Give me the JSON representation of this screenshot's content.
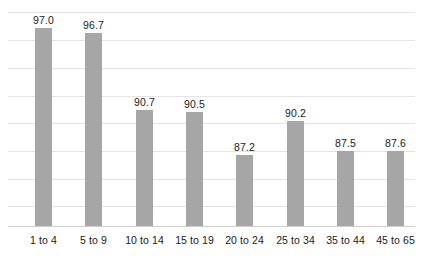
{
  "chart_data": {
    "type": "bar",
    "title": "",
    "subtitle": "",
    "xlabel": "",
    "ylabel": "",
    "categories": [
      "1 to 4",
      "5 to 9",
      "10 to 14",
      "15 to 19",
      "20 to 24",
      "25 to 34",
      "35 to 44",
      "45 to 65"
    ],
    "values": [
      97.0,
      96.7,
      90.7,
      90.5,
      87.2,
      90.2,
      87.5,
      87.6
    ],
    "value_labels": [
      "97.0",
      "96.7",
      "90.7",
      "90.5",
      "87.2",
      "90.2",
      "87.5",
      "87.6"
    ],
    "series": [
      {
        "name": "",
        "values": [
          97.0,
          96.7,
          90.7,
          90.5,
          87.2,
          90.2,
          87.5,
          87.6
        ]
      }
    ],
    "ylim": [
      81.68,
      99.15
    ],
    "ytick_values": [
      99.15,
      97.02,
      94.89,
      92.76,
      90.62,
      88.49,
      86.36,
      84.23,
      81.68
    ],
    "ytick_labels": [],
    "xtick_labels": [
      "1 to 4",
      "5 to 9",
      "10 to 14",
      "15 to 19",
      "20 to 24",
      "25 to 34",
      "35 to 44",
      "45 to 65"
    ],
    "grid": true,
    "grid_axis": "y",
    "legend": false,
    "legend_position": "none",
    "annotations": [],
    "colors": {
      "bar": "#a6a6a6",
      "gridline": "#e4e4e4",
      "axis": "#cfcfcf",
      "text": "#1a1a1a",
      "background": "#ffffff"
    }
  },
  "layout": {
    "plot": {
      "left": 8,
      "top": 0,
      "width": 407,
      "height": 227,
      "baseline_y": 226
    },
    "gridline_y": [
      12,
      40,
      68,
      96,
      123,
      151,
      179,
      206
    ],
    "bars": [
      {
        "left": 27,
        "top": 28,
        "width": 17,
        "height": 198,
        "label_left": 17,
        "label_top": 14
      },
      {
        "left": 77,
        "top": 33,
        "width": 17,
        "height": 193,
        "label_left": 67,
        "label_top": 19
      },
      {
        "left": 128,
        "top": 110,
        "width": 17,
        "height": 116,
        "label_left": 118,
        "label_top": 96
      },
      {
        "left": 178,
        "top": 112,
        "width": 17,
        "height": 114,
        "label_left": 168,
        "label_top": 98
      },
      {
        "left": 228,
        "top": 155,
        "width": 17,
        "height": 71,
        "label_left": 218,
        "label_top": 141
      },
      {
        "left": 279,
        "top": 121,
        "width": 17,
        "height": 105,
        "label_left": 269,
        "label_top": 107
      },
      {
        "left": 329,
        "top": 151,
        "width": 17,
        "height": 75,
        "label_left": 319,
        "label_top": 137
      },
      {
        "left": 379,
        "top": 151,
        "width": 17,
        "height": 75,
        "label_left": 369,
        "label_top": 137
      }
    ],
    "cat_label_left": [
      10,
      60,
      111,
      161,
      211,
      262,
      312,
      362
    ],
    "cat_label_width": 51,
    "cat_label_top": 7
  }
}
